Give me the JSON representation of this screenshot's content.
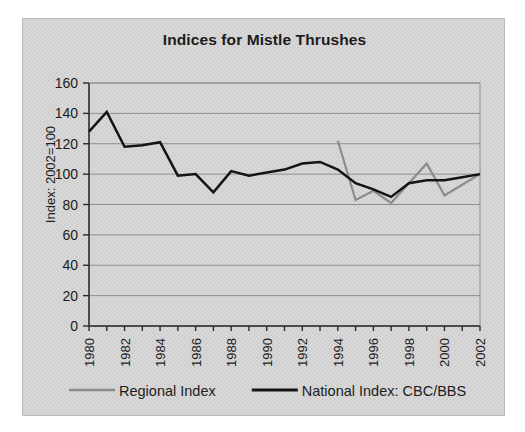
{
  "chart_data": {
    "type": "line",
    "title": "Indices for Mistle Thrushes",
    "xlabel": "",
    "ylabel": "Index: 2002=100",
    "ylim": [
      0,
      160
    ],
    "ytick_step": 20,
    "yticks": [
      "0",
      "20",
      "40",
      "60",
      "80",
      "100",
      "120",
      "140",
      "160"
    ],
    "xlim": [
      1980,
      2002
    ],
    "x": [
      1980,
      1981,
      1982,
      1983,
      1984,
      1985,
      1986,
      1987,
      1988,
      1989,
      1990,
      1991,
      1992,
      1993,
      1994,
      1995,
      1996,
      1997,
      1998,
      1999,
      2000,
      2001,
      2002
    ],
    "xticks": [
      "1980",
      "1982",
      "1984",
      "1986",
      "1988",
      "1990",
      "1992",
      "1994",
      "1996",
      "1998",
      "2000",
      "2002"
    ],
    "xtick_values": [
      1980,
      1982,
      1984,
      1986,
      1988,
      1990,
      1992,
      1994,
      1996,
      1998,
      2000,
      2002
    ],
    "grid": "horizontal",
    "legend_position": "bottom",
    "series": [
      {
        "name": "Regional Index",
        "color": "#8c8c8c",
        "x": [
          1994,
          1995,
          1996,
          1997,
          1998,
          1999,
          2000,
          2001,
          2002
        ],
        "values": [
          122,
          83,
          89,
          81,
          94,
          107,
          86,
          93,
          100
        ]
      },
      {
        "name": "National Index: CBC/BBS",
        "color": "#141414",
        "x": [
          1980,
          1981,
          1982,
          1983,
          1984,
          1985,
          1986,
          1987,
          1988,
          1989,
          1990,
          1991,
          1992,
          1993,
          1994,
          1995,
          1996,
          1997,
          1998,
          1999,
          2000,
          2001,
          2002
        ],
        "values": [
          128,
          141,
          118,
          119,
          121,
          99,
          100,
          88,
          102,
          99,
          101,
          103,
          107,
          108,
          103,
          94,
          90,
          85,
          94,
          96,
          96,
          98,
          100
        ]
      }
    ],
    "legend": [
      {
        "label": "Regional Index",
        "color": "#8c8c8c"
      },
      {
        "label": "National Index: CBC/BBS",
        "color": "#141414"
      }
    ]
  }
}
